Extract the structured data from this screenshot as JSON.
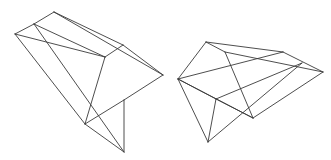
{
  "diagram": {
    "background": "#ffffff",
    "stroke_color": "#3a3a3a",
    "stroke_width": 0.9,
    "figures": [
      {
        "name": "left-polyhedron",
        "vertices": {
          "A": [
            15,
            34
          ],
          "B": [
            34,
            24
          ],
          "C": [
            54,
            12
          ],
          "D": [
            123,
            45
          ],
          "E": [
            163,
            75
          ],
          "F": [
            105,
            57
          ],
          "G": [
            124,
            100
          ],
          "H": [
            85,
            124
          ],
          "I": [
            124,
            152
          ]
        },
        "edges": [
          [
            "A",
            "B"
          ],
          [
            "B",
            "C"
          ],
          [
            "C",
            "D"
          ],
          [
            "C",
            "E"
          ],
          [
            "D",
            "E"
          ],
          [
            "A",
            "F"
          ],
          [
            "F",
            "D"
          ],
          [
            "A",
            "H"
          ],
          [
            "B",
            "I"
          ],
          [
            "B",
            "F"
          ],
          [
            "F",
            "H"
          ],
          [
            "E",
            "G"
          ],
          [
            "H",
            "G"
          ],
          [
            "G",
            "I"
          ],
          [
            "H",
            "I"
          ]
        ]
      },
      {
        "name": "right-polyhedron",
        "vertices": {
          "P": [
            178,
            79
          ],
          "Q": [
            206,
            42
          ],
          "R": [
            225,
            52
          ],
          "S": [
            283,
            52
          ],
          "T": [
            302,
            63
          ],
          "U": [
            323,
            72
          ],
          "V": [
            216,
            99
          ],
          "W": [
            253,
            118
          ],
          "X": [
            208,
            142
          ]
        },
        "edges": [
          [
            "P",
            "Q"
          ],
          [
            "Q",
            "S"
          ],
          [
            "S",
            "U"
          ],
          [
            "Q",
            "R"
          ],
          [
            "R",
            "U"
          ],
          [
            "R",
            "W"
          ],
          [
            "P",
            "S"
          ],
          [
            "P",
            "V"
          ],
          [
            "P",
            "X"
          ],
          [
            "V",
            "X"
          ],
          [
            "V",
            "T"
          ],
          [
            "X",
            "T"
          ],
          [
            "V",
            "W"
          ],
          [
            "W",
            "U"
          ],
          [
            "P",
            "W"
          ]
        ]
      }
    ]
  }
}
